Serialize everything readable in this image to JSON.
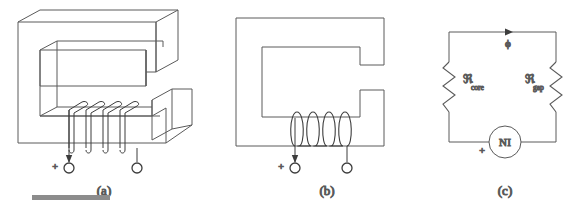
{
  "figure": {
    "stroke_color": "#5a5a5a",
    "scalebar_color": "#8c8c8c",
    "background": "#ffffff",
    "panels": [
      {
        "id": "a",
        "caption": "(a)",
        "description": "Three-dimensional view of C-shaped magnetic core with air gap and coil winding",
        "coil_turns": 4,
        "terminals": [
          {
            "name": "positive-terminal",
            "marker": "+",
            "has_arrow": true
          },
          {
            "name": "negative-terminal",
            "marker": "",
            "has_arrow": false
          }
        ]
      },
      {
        "id": "b",
        "caption": "(b)",
        "description": "Two-dimensional cross-section of C-core with air gap and coil winding",
        "coil_turns": 4,
        "terminals": [
          {
            "name": "positive-terminal",
            "marker": "+",
            "has_arrow": true
          },
          {
            "name": "negative-terminal",
            "marker": "",
            "has_arrow": false
          }
        ]
      },
      {
        "id": "c",
        "caption": "(c)",
        "description": "Equivalent magnetic circuit with reluctances and magnetomotive force source",
        "flux_label": "ϕ",
        "source_label": "NI",
        "source_polarity": "+",
        "elements": [
          {
            "name": "core-reluctance",
            "symbol": "ℜ",
            "subscript": "core",
            "type": "resistor"
          },
          {
            "name": "gap-reluctance",
            "symbol": "ℜ",
            "subscript": "gap",
            "type": "resistor"
          },
          {
            "name": "mmf-source",
            "symbol": "NI",
            "type": "source"
          }
        ]
      }
    ],
    "scalebar": {
      "name": "scale-bar",
      "visible": true
    }
  }
}
